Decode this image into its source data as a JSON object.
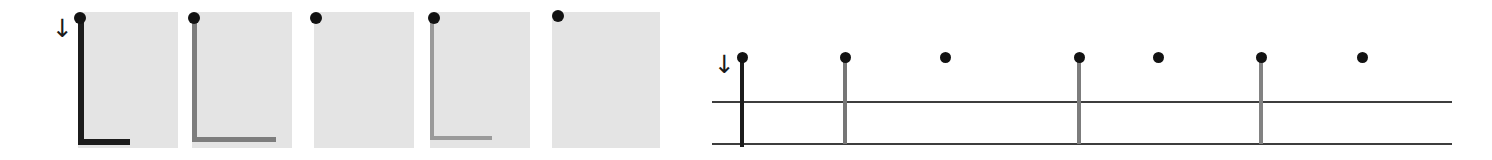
{
  "figure": {
    "width": 1492,
    "height": 160,
    "background": "#ffffff",
    "panel_fill": "#e4e4e4",
    "ink_color": "#121212",
    "rule_color": "#3d3d3d",
    "arrow_glyph": "↓",
    "arrow_name": "down-arrow-annotation"
  },
  "chart_data": {
    "type": "scatter",
    "title": "",
    "subtitle": "",
    "xlabel": "",
    "ylabel": "",
    "grid": false,
    "legend_position": "none",
    "panels": [
      {
        "index": 1,
        "label": "",
        "x": 78,
        "width": 100,
        "dot_x": 80,
        "dot_y": 18,
        "dot_radius": 6,
        "axis_opacity": 1.0,
        "axis_color": "#1c1c1c",
        "axis_weight": 6,
        "axis_v_from": 18,
        "axis_v_to": 145,
        "axis_h_from": 78,
        "axis_h_to": 130,
        "has_axis": true
      },
      {
        "index": 2,
        "label": "",
        "x": 192,
        "width": 100,
        "dot_x": 194,
        "dot_y": 18,
        "dot_radius": 6,
        "axis_opacity": 0.45,
        "axis_color": "#7d7d7d",
        "axis_weight": 5,
        "axis_v_from": 18,
        "axis_v_to": 142,
        "axis_h_from": 192,
        "axis_h_to": 276,
        "has_axis": true
      },
      {
        "index": 3,
        "label": "",
        "x": 314,
        "width": 100,
        "dot_x": 316,
        "dot_y": 18,
        "dot_radius": 6,
        "axis_opacity": 0.0,
        "axis_color": "#c8c8c8",
        "axis_weight": 0,
        "axis_v_from": 18,
        "axis_v_to": 18,
        "axis_h_from": 314,
        "axis_h_to": 314,
        "has_axis": false
      },
      {
        "index": 4,
        "label": "",
        "x": 430,
        "width": 100,
        "dot_x": 434,
        "dot_y": 18,
        "dot_radius": 6,
        "axis_opacity": 0.22,
        "axis_color": "#9a9a9a",
        "axis_weight": 4,
        "axis_v_from": 18,
        "axis_v_to": 140,
        "axis_h_from": 430,
        "axis_h_to": 492,
        "has_axis": true
      },
      {
        "index": 5,
        "label": "",
        "x": 552,
        "width": 108,
        "dot_x": 558,
        "dot_y": 16,
        "dot_radius": 6,
        "axis_opacity": 0.0,
        "axis_color": "#c8c8c8",
        "axis_weight": 0,
        "axis_v_from": 16,
        "axis_v_to": 16,
        "axis_h_from": 552,
        "axis_h_to": 552,
        "has_axis": false
      }
    ],
    "panel_top": 12,
    "panel_bottom": 148,
    "left_arrow": {
      "x": 52,
      "y": 16,
      "glyph": "↓"
    },
    "stem_plot": {
      "x_left": 712,
      "x_right": 1452,
      "dot_y": 57,
      "dot_radius": 5.5,
      "rule_upper_y": 101,
      "rule_lower_y": 143,
      "rule_weight": 2,
      "arrow": {
        "x": 714,
        "y": 52,
        "glyph": "↓"
      },
      "axis_stem": {
        "x": 740,
        "top": 57,
        "bottom": 147,
        "color": "#1c1c1c",
        "weight": 4,
        "opacity": 1.0
      },
      "stems": [
        {
          "index": 1,
          "x": 740,
          "value": 1.0,
          "has_stem": true,
          "opacity": 1.0,
          "color": "#1c1c1c",
          "weight": 4,
          "stem_bottom": 147
        },
        {
          "index": 2,
          "x": 843,
          "value": 1.0,
          "has_stem": true,
          "opacity": 0.55,
          "color": "#767676",
          "weight": 4,
          "stem_bottom": 144
        },
        {
          "index": 3,
          "x": 945,
          "value": 1.0,
          "has_stem": false,
          "opacity": 0.0,
          "color": "#bfbfbf",
          "weight": 0,
          "stem_bottom": 57
        },
        {
          "index": 4,
          "x": 1077,
          "value": 1.0,
          "has_stem": true,
          "opacity": 0.5,
          "color": "#7c7c7c",
          "weight": 4,
          "stem_bottom": 144
        },
        {
          "index": 5,
          "x": 1158,
          "value": 1.0,
          "has_stem": false,
          "opacity": 0.0,
          "color": "#bfbfbf",
          "weight": 0,
          "stem_bottom": 57
        },
        {
          "index": 6,
          "x": 1259,
          "value": 1.0,
          "has_stem": true,
          "opacity": 0.45,
          "color": "#828282",
          "weight": 4,
          "stem_bottom": 144
        },
        {
          "index": 7,
          "x": 1362,
          "value": 1.0,
          "has_stem": false,
          "opacity": 0.0,
          "color": "#bfbfbf",
          "weight": 0,
          "stem_bottom": 57
        }
      ]
    }
  }
}
